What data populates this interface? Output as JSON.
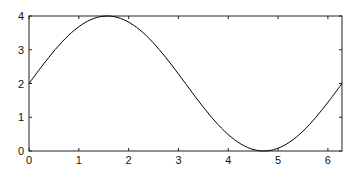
{
  "chart_data": {
    "type": "line",
    "title": "",
    "xlabel": "",
    "ylabel": "",
    "xlim": [
      0,
      6.2832
    ],
    "ylim": [
      0,
      4
    ],
    "grid": false,
    "legend": null,
    "xticks": [
      0,
      1,
      2,
      3,
      4,
      5,
      6
    ],
    "yticks": [
      0,
      1,
      2,
      3,
      4
    ],
    "xtick_labels": [
      "0",
      "1",
      "2",
      "3",
      "4",
      "5",
      "6"
    ],
    "ytick_labels": [
      "0",
      "1",
      "2",
      "3",
      "4"
    ],
    "series": [
      {
        "name": "y = 2 + 2 sin(x)",
        "color": "#000000",
        "x": [
          0,
          0.2618,
          0.5236,
          0.7854,
          1.0472,
          1.309,
          1.5708,
          1.8326,
          2.0944,
          2.3562,
          2.618,
          2.8798,
          3.1416,
          3.4034,
          3.6652,
          3.927,
          4.1888,
          4.4506,
          4.7124,
          4.9742,
          5.236,
          5.4978,
          5.7596,
          6.0214,
          6.2832
        ],
        "values": [
          2.0,
          2.5176,
          3.0,
          3.4142,
          3.7321,
          3.9319,
          4.0,
          3.9319,
          3.7321,
          3.4142,
          3.0,
          2.5176,
          2.0,
          1.4824,
          1.0,
          0.5858,
          0.2679,
          0.0681,
          0.0,
          0.0681,
          0.2679,
          0.5858,
          1.0,
          1.4824,
          2.0
        ]
      }
    ]
  }
}
